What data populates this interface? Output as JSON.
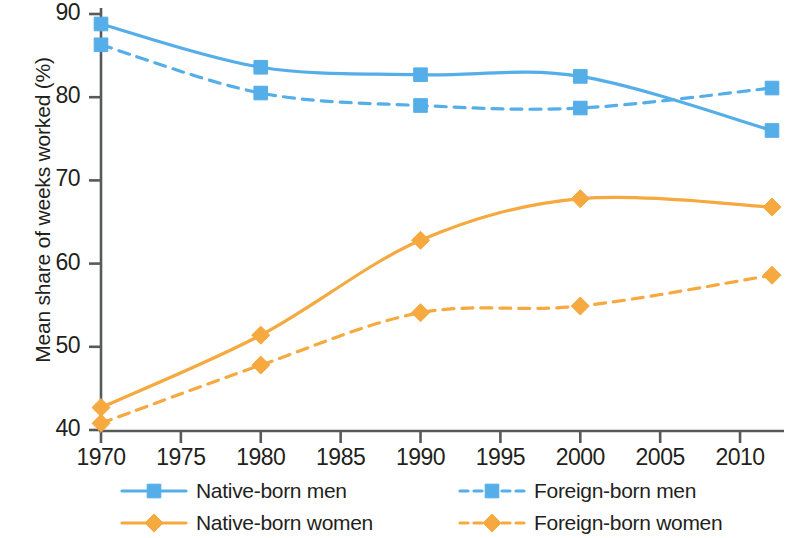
{
  "chart_data": {
    "type": "line",
    "title": "",
    "xlabel": "",
    "ylabel": "Mean share of weeks worked (%)",
    "x": [
      1970,
      1980,
      1990,
      2000,
      2012
    ],
    "xlim": [
      1970,
      2012
    ],
    "ylim": [
      40,
      90
    ],
    "xticks": [
      1970,
      1975,
      1980,
      1985,
      1990,
      1995,
      2000,
      2005,
      2010
    ],
    "xtick_labels": [
      "1970",
      "1975",
      "1980",
      "1985",
      "1990",
      "1995",
      "2000",
      "2005",
      "2010"
    ],
    "yticks": [
      40,
      50,
      60,
      70,
      80,
      90
    ],
    "ytick_labels": [
      "40",
      "50",
      "60",
      "70",
      "80",
      "90"
    ],
    "grid": false,
    "legend_position": "below-axes",
    "series": [
      {
        "name": "Native-born men",
        "values": [
          88.8,
          83.6,
          82.7,
          82.5,
          76.0
        ],
        "color": "#55aee8",
        "marker": "square",
        "linestyle": "solid"
      },
      {
        "name": "Foreign-born men",
        "values": [
          86.3,
          80.5,
          79.0,
          78.7,
          81.1
        ],
        "color": "#55aee8",
        "marker": "square",
        "linestyle": "dashed"
      },
      {
        "name": "Native-born women",
        "values": [
          42.7,
          51.4,
          62.8,
          67.8,
          66.8
        ],
        "color": "#f5a93f",
        "marker": "diamond",
        "linestyle": "solid"
      },
      {
        "name": "Foreign-born women",
        "values": [
          40.8,
          47.8,
          54.1,
          54.9,
          58.6
        ],
        "color": "#f5a93f",
        "marker": "diamond",
        "linestyle": "dashed"
      }
    ]
  },
  "legend": {
    "items": [
      {
        "label": "Native-born men"
      },
      {
        "label": "Foreign-born men"
      },
      {
        "label": "Native-born women"
      },
      {
        "label": "Foreign-born women"
      }
    ]
  },
  "colors": {
    "men": "#55aee8",
    "women": "#f5a93f",
    "axis": "#58595b",
    "text": "#231f20"
  }
}
